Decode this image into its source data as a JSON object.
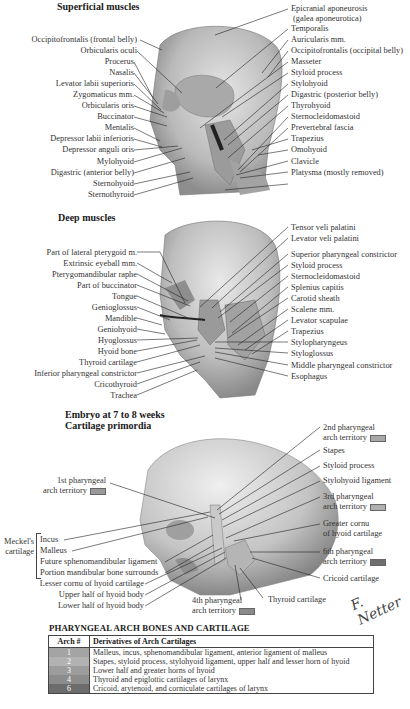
{
  "sections": {
    "superficial": {
      "title": "Superficial muscles",
      "left_labels": [
        "Occipitofrontalis (frontal belly)",
        "Orbicularis oculi",
        "Procerus",
        "Nasalis",
        "Levator labii superioris",
        "Zygomaticus mm.",
        "Orbicularis oris",
        "Buccinator",
        "Mentalis",
        "Depressor labii inferioris",
        "Depressor anguli oris",
        "Mylohyoid",
        "Digastric (anterior belly)",
        "Sternohyoid",
        "Sternothyroid"
      ],
      "right_labels": [
        "Epicranial aponeurosis",
        "(galea aponeurotica)",
        "Temporalis",
        "Auricularis mm.",
        "Occipitofrontalis (occipital belly)",
        "Masseter",
        "Styloid process",
        "Stylohyoid",
        "Digastric (posterior belly)",
        "Thyrohyoid",
        "Sternocleidomastoid",
        "Prevertebral fascia",
        "Trapezius",
        "Omohyoid",
        "Clavicle",
        "Platysma (mostly removed)"
      ]
    },
    "deep": {
      "title": "Deep muscles",
      "left_labels": [
        "Part of lateral pterygoid m.",
        "Extrinsic eyeball mm.",
        "Pterygomandibular raphe",
        "Part of buccinator",
        "Tongue",
        "Genioglossus",
        "Mandible",
        "Geniohyoid",
        "Hyoglossus",
        "Hyoid bone",
        "Thyroid cartilage",
        "Inferior pharyngeal constrictor",
        "Cricothyroid",
        "Trachea"
      ],
      "right_labels": [
        "Tensor veli palatini",
        "Levator veli palatini",
        "Superior pharyngeal constrictor",
        "Styloid process",
        "Sternocleidomastoid",
        "Splenius capitis",
        "Carotid sheath",
        "Scalene mm.",
        "Levator scapulae",
        "Trapezius",
        "Stylopharyngeus",
        "Styloglossus",
        "Middle pharyngeal constrictor",
        "Esophagus"
      ]
    },
    "embryo": {
      "title_line1": "Embryo at 7 to 8 weeks",
      "title_line2": "Cartilage primordia",
      "first_arch": [
        "1st pharyngeal",
        "arch territory"
      ],
      "meckel": [
        "Meckel's",
        "cartilage"
      ],
      "meckel_items": [
        "Incus",
        "Malleus",
        "Future sphenomandibular ligament",
        "Portion mandibular bone surrounds"
      ],
      "left_lower_labels": [
        "Lesser cornu of hyoid cartilage",
        "Upper half of hyoid body",
        "Lower half of hyoid body"
      ],
      "fourth_arch": [
        "4th pharyngeal",
        "arch territory"
      ],
      "thyroid": "Thyroid cartilage",
      "right_labels": {
        "second_arch": [
          "2nd pharyngeal",
          "arch territory"
        ],
        "stapes": "Stapes",
        "styloid": "Styloid process",
        "stylohyoid": "Stylohyoid ligament",
        "third_arch": [
          "3rd pharyngeal",
          "arch territory"
        ],
        "greater_cornu": [
          "Greater cornu",
          "of hyoid cartilage"
        ],
        "sixth_arch": [
          "6th pharyngeal",
          "arch territory"
        ],
        "cricoid": "Cricoid cartilage"
      },
      "swatch_colors": {
        "arch1": "#9a9a9a",
        "arch2": "#a8a8a8",
        "arch3": "#b0b0b0",
        "arch4": "#8a8a8a",
        "arch6": "#6e6e6e"
      }
    }
  },
  "table": {
    "title": "PHARYNGEAL ARCH BONES AND CARTILAGE",
    "headers": [
      "Arch #",
      "Derivatives of Arch Cartilages"
    ],
    "rows": [
      {
        "arch": "1",
        "derivatives": "Malleus, incus, sphenomandibular ligament, anterior ligament of malleus",
        "color": "#a4a4a4"
      },
      {
        "arch": "2",
        "derivatives": "Stapes, styloid process, stylohyoid ligament, upper half and lesser horn of hyoid",
        "color": "#b2b2b2"
      },
      {
        "arch": "3",
        "derivatives": "Lower half and greater horns of hyoid",
        "color": "#9c9c9c"
      },
      {
        "arch": "4",
        "derivatives": "Thyroid and epiglottic cartilages of larynx",
        "color": "#8c8c8c"
      },
      {
        "arch": "6",
        "derivatives": "Cricoid, arytenoid, and corniculate cartilages of larynx",
        "color": "#6c6c6c"
      }
    ]
  },
  "signature": "F. Netter"
}
